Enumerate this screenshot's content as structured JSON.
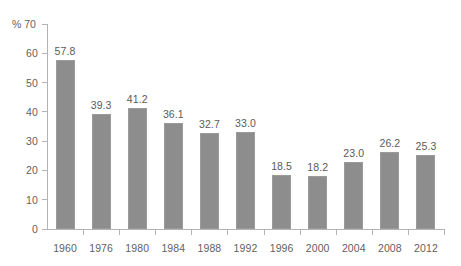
{
  "chart_data": {
    "type": "bar",
    "title": "",
    "xlabel": "",
    "ylabel": "%",
    "categories": [
      "1960",
      "1976",
      "1980",
      "1984",
      "1988",
      "1992",
      "1996",
      "2000",
      "2004",
      "2008",
      "2012"
    ],
    "values": [
      57.8,
      39.3,
      41.2,
      36.1,
      32.7,
      33.0,
      18.5,
      18.2,
      23.0,
      26.2,
      25.3
    ],
    "value_labels": [
      "57.8",
      "39.3",
      "41.2",
      "36.1",
      "32.7",
      "33.0",
      "18.5",
      "18.2",
      "23.0",
      "26.2",
      "25.3"
    ],
    "ylim": [
      0,
      70
    ],
    "yticks": [
      0,
      10,
      20,
      30,
      40,
      50,
      60,
      70
    ],
    "ytick_labels": [
      "0",
      "10",
      "20",
      "30",
      "40",
      "50",
      "60",
      "70"
    ],
    "y_unit_label": "% 70",
    "grid": false,
    "legend": null,
    "bar_color": "#8d8d8d",
    "axis_color": "#b4b4b4",
    "text_color": "#5a5a5a",
    "background": "#ffffff"
  }
}
